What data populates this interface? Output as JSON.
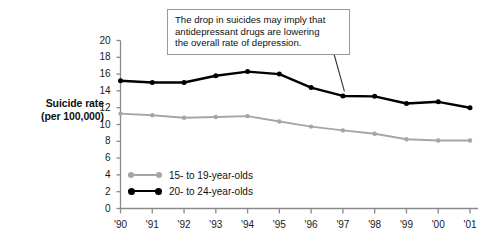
{
  "chart_data": {
    "type": "line",
    "title": "",
    "xlabel": "",
    "ylabel": "Suicide rate (per 100,000)",
    "ylabel_line1": "Suicide rate",
    "ylabel_line2": "(per 100,000)",
    "categories": [
      "'90",
      "'91",
      "'92",
      "'93",
      "'94",
      "'95",
      "'96",
      "'97",
      "'98",
      "'99",
      "'00",
      "'01"
    ],
    "ylim": [
      0,
      20
    ],
    "yticks": [
      0,
      2,
      4,
      6,
      8,
      10,
      12,
      14,
      16,
      18,
      20
    ],
    "grid": false,
    "legend_position": "inside-bottom-left",
    "series": [
      {
        "name": "15- to 19-year-olds",
        "color": "#a6a6a6",
        "values": [
          11.3,
          11.1,
          10.8,
          10.9,
          11.0,
          10.35,
          9.75,
          9.3,
          8.9,
          8.25,
          8.1,
          8.1
        ]
      },
      {
        "name": "20- to 24-year-olds",
        "color": "#000000",
        "values": [
          15.2,
          15.0,
          15.0,
          15.8,
          16.3,
          16.0,
          14.4,
          13.4,
          13.35,
          12.5,
          12.7,
          12.0
        ]
      }
    ],
    "annotations": [
      {
        "text": "The drop in suicides may imply that antidepressant drugs are lowering the overall rate of depression.",
        "lines": [
          "The drop in suicides may imply that",
          "antidepressant drugs are lowering",
          "the overall rate of depression."
        ],
        "points_to_series": "20- to 24-year-olds",
        "points_to_category": "'97"
      }
    ]
  },
  "colors": {
    "axis": "#8a8a8a",
    "text": "#1a1a1a",
    "series_gray": "#a6a6a6",
    "series_black": "#000000",
    "callout_border": "#9a9a9a",
    "callout_background": "#ffffff"
  }
}
